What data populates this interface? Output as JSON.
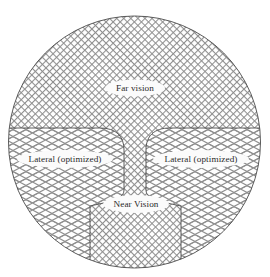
{
  "figure": {
    "name": "vision-zone-diagram",
    "shape": "circle",
    "background_color": "#ffffff",
    "outline_color": "#4a4a4a",
    "hatch_color": "#8a8a8a",
    "label_text_color": "#2a2a2a",
    "label_plate_color": "#fbfbfb"
  },
  "zones": {
    "far": {
      "label": "Far vision",
      "hatch": "fine-crosshatch",
      "position": "top",
      "label_x": 135,
      "label_y": 88,
      "plate_w": 54,
      "plate_h": 14
    },
    "lateral_left": {
      "label": "Lateral (optimized)",
      "hatch": "diamond-lattice",
      "position": "left",
      "label_x": 65,
      "label_y": 159,
      "plate_w": 88,
      "plate_h": 15
    },
    "lateral_right": {
      "label": "Lateral (optimized)",
      "hatch": "diamond-lattice",
      "position": "right",
      "label_x": 201,
      "label_y": 159,
      "plate_w": 88,
      "plate_h": 15
    },
    "near": {
      "label": "Near Vision",
      "hatch": "fine-crosshatch",
      "position": "bottom-center",
      "label_x": 136,
      "label_y": 204,
      "plate_w": 60,
      "plate_h": 15
    }
  },
  "geometry": {
    "circle_cx": 134.5,
    "circle_cy": 142,
    "circle_r": 126,
    "divider_y": 128,
    "waist_x_left": 124,
    "waist_x_right": 146
  }
}
